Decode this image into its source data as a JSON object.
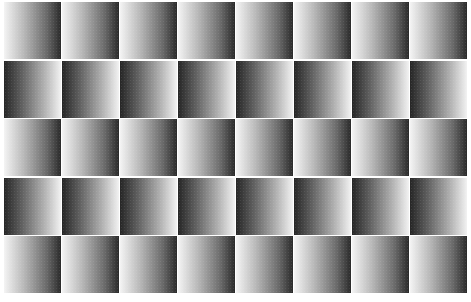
{
  "figure": {
    "rows": 5,
    "columns": 8,
    "row_directions": [
      "light-to-dark",
      "dark-to-light",
      "light-to-dark",
      "dark-to-light",
      "light-to-dark"
    ],
    "colors": {
      "light": "#f4f4f4",
      "dark": "#262626",
      "background": "#ffffff"
    }
  }
}
